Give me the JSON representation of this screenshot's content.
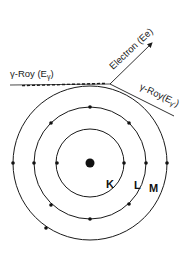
{
  "diagram": {
    "nucleus": {
      "cx": 90,
      "cy": 163,
      "r": 4.5
    },
    "shells": [
      {
        "name": "K",
        "r": 34,
        "label": "K",
        "label_x": 106,
        "label_y": 188
      },
      {
        "name": "L",
        "r": 56,
        "label": "L",
        "label_x": 134,
        "label_y": 189
      },
      {
        "name": "M",
        "r": 77,
        "label": "M",
        "label_x": 150,
        "label_y": 192
      }
    ],
    "incoming_ray": {
      "label": "γ-Roy (Eγ)",
      "label_main": "γ-Roy (E",
      "label_sub": "γ",
      "label_end": ")"
    },
    "electron": {
      "label": "Electron (Ee)"
    },
    "scattered_ray": {
      "label": "γ-Roy(Eγ')",
      "label_main": "γ-Roy(E",
      "label_sub": "γ'",
      "label_end": ")"
    },
    "colors": {
      "line": "#1a1a1a",
      "background": "#ffffff"
    }
  }
}
